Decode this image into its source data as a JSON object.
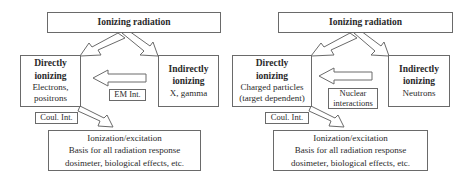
{
  "diagrams": [
    {
      "title": "Ionizing radiation",
      "direct": {
        "heading1": "Directly",
        "heading2": "ionizing",
        "detail1": "Electrons,",
        "detail2": "positrons"
      },
      "indirect": {
        "heading1": "Indirectly",
        "heading2": "ionizing",
        "detail1": "X, gamma"
      },
      "interaction": {
        "line1": "EM Int."
      },
      "coulomb": "Coul. Int.",
      "result": {
        "line1": "Ionization/excitation",
        "line2": "Basis for all radiation response",
        "line3": "dosimeter, biological effects, etc."
      }
    },
    {
      "title": "Ionizing radiation",
      "direct": {
        "heading1": "Directly",
        "heading2": "ionizing",
        "detail1": "Charged particles",
        "detail2": "(target dependent)"
      },
      "indirect": {
        "heading1": "Indirectly",
        "heading2": "ionizing",
        "detail1": "Neutrons"
      },
      "interaction": {
        "line1": "Nuclear",
        "line2": "interactions"
      },
      "coulomb": "Coul. Int.",
      "result": {
        "line1": "Ionization/excitation",
        "line2": "Basis for all radiation response",
        "line3": "dosimeter, biological effects, etc."
      }
    }
  ],
  "colors": {
    "stroke": "#6a6a6a",
    "text": "#2a2a2a",
    "background": "#ffffff"
  }
}
